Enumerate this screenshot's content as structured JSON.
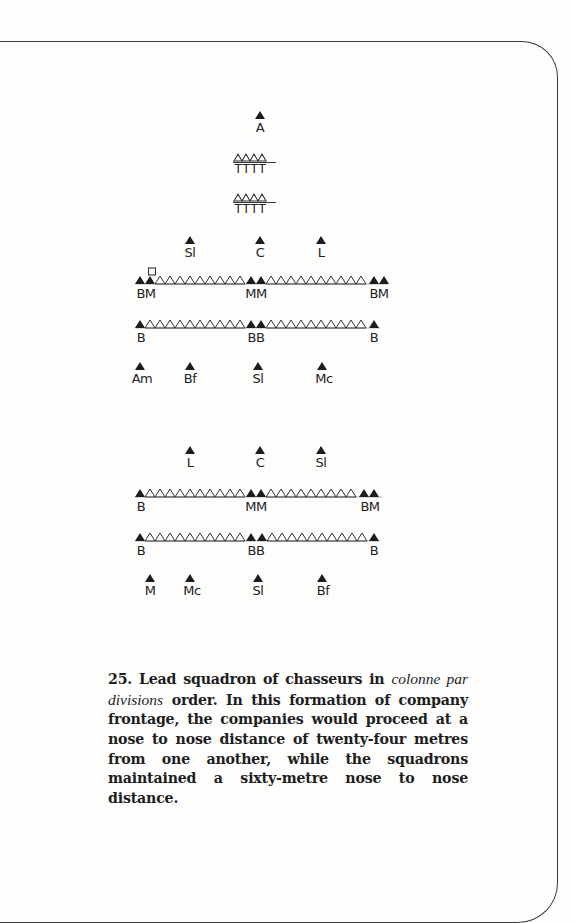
{
  "figure": {
    "number": "25.",
    "caption_part1": "Lead squadron of chasseurs in",
    "caption_italic": "colonne par divisions",
    "caption_part2": "order. In this formation of company frontage, the companies would proceed at a nose to nose distance of twenty-four metres from one another, while the squadrons maintained a sixty-metre nose to nose distance."
  },
  "formation_top": {
    "leader": {
      "label": "A"
    },
    "trumpeter_rows": [
      {
        "labels": [
          "T",
          "T",
          "T",
          "T"
        ]
      },
      {
        "labels": [
          "T",
          "T",
          "T",
          "T"
        ]
      }
    ],
    "officers": [
      {
        "label": "Sl"
      },
      {
        "label": "C"
      },
      {
        "label": "L"
      }
    ],
    "rank_1": {
      "left": "BM",
      "center": "MM",
      "right": "BM"
    },
    "rank_2": {
      "left": "B",
      "center": "BB",
      "right": "B"
    },
    "rear": [
      {
        "label": "Am"
      },
      {
        "label": "Bf"
      },
      {
        "label": "Sl"
      },
      {
        "label": "Mc"
      }
    ]
  },
  "formation_bottom": {
    "officers": [
      {
        "label": "L"
      },
      {
        "label": "C"
      },
      {
        "label": "Sl"
      }
    ],
    "rank_1": {
      "left": "B",
      "center": "MM",
      "right": "BM"
    },
    "rank_2": {
      "left": "B",
      "center": "BB",
      "right": "B"
    },
    "rear": [
      {
        "label": "M"
      },
      {
        "label": "Mc"
      },
      {
        "label": "Sl"
      },
      {
        "label": "Bf"
      }
    ]
  },
  "legend_symbols": {
    "filled_triangle": "officer/NCO",
    "hollow_triangle": "trooper",
    "square": "guidon"
  },
  "colors": {
    "ink": "#222222",
    "paper": "#fdfdfc"
  }
}
